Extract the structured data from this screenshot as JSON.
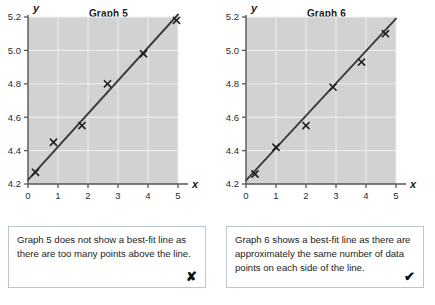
{
  "page": {
    "background": "#ffffff",
    "plot_background": "#d2d2d2",
    "grid_color": "#efefef",
    "line_color": "#3b3b3b",
    "caption_border": "#b9c6cf"
  },
  "panels": [
    {
      "title": "Graph 5",
      "y_axis_label": "y",
      "x_axis_label": "x",
      "caption": "Graph 5 does not show a best-fit line as there are too many points above the line.",
      "verdict_icon": "cross-mark",
      "verdict_symbol": "✘"
    },
    {
      "title": "Graph 6",
      "y_axis_label": "y",
      "x_axis_label": "x",
      "caption": "Graph 6 shows a best-fit line as there are approximately the same number of data points on each side of the line.",
      "verdict_icon": "check-mark",
      "verdict_symbol": "✔"
    }
  ],
  "chart_data": [
    {
      "type": "scatter",
      "title": "Graph 5",
      "xlabel": "x",
      "ylabel": "y",
      "xlim": [
        0,
        5
      ],
      "ylim": [
        4.2,
        5.2
      ],
      "xticks": [
        0,
        1,
        2,
        3,
        4,
        5
      ],
      "xticklabels": [
        "0",
        "1",
        "2",
        "3",
        "4",
        "5"
      ],
      "yticks": [
        4.2,
        4.4,
        4.6,
        4.8,
        5.0,
        5.2
      ],
      "yticklabels": [
        "4.2",
        "4.4",
        "4.6",
        "4.8",
        "5.0",
        "5.2"
      ],
      "grid": true,
      "legend": false,
      "marker": "x",
      "points": [
        {
          "x": 0.25,
          "y": 4.27
        },
        {
          "x": 0.85,
          "y": 4.45
        },
        {
          "x": 1.8,
          "y": 4.55
        },
        {
          "x": 2.65,
          "y": 4.8
        },
        {
          "x": 3.85,
          "y": 4.98
        },
        {
          "x": 4.95,
          "y": 5.18
        }
      ],
      "fit_line": {
        "x0": 0.0,
        "y0": 4.225,
        "x1": 5.0,
        "y1": 5.215
      },
      "annotation": "Graph 5 does not show a best-fit line as there are too many points above the line."
    },
    {
      "type": "scatter",
      "title": "Graph 6",
      "xlabel": "x",
      "ylabel": "y",
      "xlim": [
        0,
        5
      ],
      "ylim": [
        4.2,
        5.2
      ],
      "xticks": [
        0,
        1,
        2,
        3,
        4,
        5
      ],
      "xticklabels": [
        "0",
        "1",
        "2",
        "3",
        "4",
        "5"
      ],
      "yticks": [
        4.2,
        4.4,
        4.6,
        4.8,
        5.0,
        5.2
      ],
      "yticklabels": [
        "4.2",
        "4.4",
        "4.6",
        "4.8",
        "5.0",
        "5.2"
      ],
      "grid": true,
      "legend": false,
      "marker": "x",
      "points": [
        {
          "x": 0.3,
          "y": 4.26
        },
        {
          "x": 1.0,
          "y": 4.42
        },
        {
          "x": 2.0,
          "y": 4.55
        },
        {
          "x": 2.9,
          "y": 4.78
        },
        {
          "x": 3.85,
          "y": 4.93
        },
        {
          "x": 4.65,
          "y": 5.1
        }
      ],
      "fit_line": {
        "x0": 0.0,
        "y0": 4.222,
        "x1": 5.0,
        "y1": 5.19
      },
      "annotation": "Graph 6 shows a best-fit line as there are approximately the same number of data points on each side of the line."
    }
  ]
}
